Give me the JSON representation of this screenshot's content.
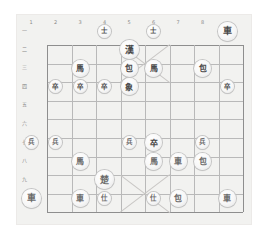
{
  "app": {
    "title": "Xiangqi Board",
    "background": "#ffffff",
    "board_background": "#f2f2f0",
    "line_color": "#b9b9b9",
    "edge_color": "#8e8e8e",
    "piece_face": "#f7f7f7",
    "piece_text": "#5a5a5a"
  },
  "board": {
    "files": 9,
    "ranks": 10,
    "file_labels": [
      "1",
      "2",
      "3",
      "4",
      "5",
      "6",
      "7",
      "8"
    ],
    "rank_labels": [
      "一",
      "二",
      "三",
      "四",
      "五",
      "六",
      "七",
      "八",
      "九"
    ],
    "palace_top": {
      "files": [
        3,
        5
      ],
      "ranks": [
        0,
        2
      ]
    },
    "palace_bottom": {
      "files": [
        3,
        5
      ],
      "ranks": [
        6,
        8
      ]
    }
  },
  "pieces": [
    {
      "name": "advisor-black-1",
      "label": "士",
      "side": "black",
      "file": 3,
      "rank": 0,
      "size": "tiny"
    },
    {
      "name": "advisor-black-2",
      "label": "士",
      "side": "black",
      "file": 5,
      "rank": 0,
      "size": "tiny"
    },
    {
      "name": "chariot-black-1",
      "label": "車",
      "side": "black",
      "file": 8,
      "rank": 0,
      "size": "king"
    },
    {
      "name": "general-black",
      "label": "漢",
      "side": "black",
      "file": 4,
      "rank": 1,
      "size": "king"
    },
    {
      "name": "horse-black-1",
      "label": "馬",
      "side": "black",
      "file": 2,
      "rank": 2,
      "size": "normal"
    },
    {
      "name": "cannon-black-1",
      "label": "包",
      "side": "black",
      "file": 4,
      "rank": 2,
      "size": "normal"
    },
    {
      "name": "horse-black-2",
      "label": "馬",
      "side": "black",
      "file": 5,
      "rank": 2,
      "size": "normal"
    },
    {
      "name": "cannon-black-2",
      "label": "包",
      "side": "black",
      "file": 7,
      "rank": 2,
      "size": "normal"
    },
    {
      "name": "soldier-black-1",
      "label": "卒",
      "side": "black",
      "file": 1,
      "rank": 3,
      "size": "tiny"
    },
    {
      "name": "soldier-black-2",
      "label": "卒",
      "side": "black",
      "file": 2,
      "rank": 3,
      "size": "tiny"
    },
    {
      "name": "soldier-black-3",
      "label": "卒",
      "side": "black",
      "file": 3,
      "rank": 3,
      "size": "tiny"
    },
    {
      "name": "elephant-black-1",
      "label": "象",
      "side": "black",
      "file": 4,
      "rank": 3,
      "size": "normal"
    },
    {
      "name": "soldier-black-4",
      "label": "卒",
      "side": "black",
      "file": 8,
      "rank": 3,
      "size": "tiny"
    },
    {
      "name": "soldier-red-1",
      "label": "兵",
      "side": "red",
      "file": 0,
      "rank": 6,
      "size": "tiny"
    },
    {
      "name": "soldier-red-2",
      "label": "兵",
      "side": "red",
      "file": 1,
      "rank": 6,
      "size": "tiny"
    },
    {
      "name": "soldier-red-3",
      "label": "兵",
      "side": "red",
      "file": 4,
      "rank": 6,
      "size": "tiny"
    },
    {
      "name": "soldier-black-5",
      "label": "卒",
      "side": "black",
      "file": 5,
      "rank": 6,
      "size": "normal"
    },
    {
      "name": "soldier-red-4",
      "label": "兵",
      "side": "red",
      "file": 7,
      "rank": 6,
      "size": "tiny"
    },
    {
      "name": "horse-red-1",
      "label": "馬",
      "side": "red",
      "file": 2,
      "rank": 7,
      "size": "normal"
    },
    {
      "name": "horse-red-2",
      "label": "馬",
      "side": "red",
      "file": 5,
      "rank": 7,
      "size": "normal"
    },
    {
      "name": "chariot-red-1",
      "label": "車",
      "side": "red",
      "file": 6,
      "rank": 7,
      "size": "normal"
    },
    {
      "name": "cannon-red-1",
      "label": "包",
      "side": "red",
      "file": 7,
      "rank": 7,
      "size": "normal"
    },
    {
      "name": "general-red",
      "label": "楚",
      "side": "red",
      "file": 3,
      "rank": 8,
      "size": "king"
    },
    {
      "name": "chariot-red-2",
      "label": "車",
      "side": "red",
      "file": 0,
      "rank": 9,
      "size": "king"
    },
    {
      "name": "chariot-red-3",
      "label": "車",
      "side": "red",
      "file": 2,
      "rank": 9,
      "size": "normal"
    },
    {
      "name": "advisor-red-1",
      "label": "仕",
      "side": "red",
      "file": 3,
      "rank": 9,
      "size": "tiny"
    },
    {
      "name": "advisor-red-2",
      "label": "仕",
      "side": "red",
      "file": 5,
      "rank": 9,
      "size": "tiny"
    },
    {
      "name": "cannon-red-2",
      "label": "包",
      "side": "red",
      "file": 6,
      "rank": 9,
      "size": "normal"
    },
    {
      "name": "chariot-red-4",
      "label": "車",
      "side": "red",
      "file": 8,
      "rank": 9,
      "size": "normal"
    }
  ]
}
